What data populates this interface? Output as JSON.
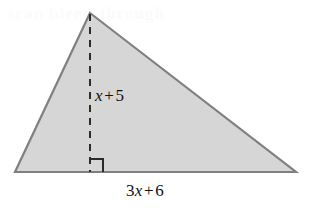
{
  "figure": {
    "kind": "geometry-diagram",
    "shape": "triangle",
    "canvas": {
      "width": 309,
      "height": 212
    },
    "colors": {
      "fill": "#d6d6d6",
      "stroke": "#808080",
      "text": "#111111",
      "background": "#ffffff",
      "ghost": "#fbfbfb"
    },
    "vertices": {
      "apex": {
        "x": 90,
        "y": 13
      },
      "base_left": {
        "x": 15,
        "y": 172
      },
      "base_right": {
        "x": 296,
        "y": 172
      }
    },
    "altitude": {
      "from": {
        "x": 90,
        "y": 13
      },
      "to": {
        "x": 90,
        "y": 172
      },
      "style": "dashed"
    },
    "right_angle_marker": {
      "corner": {
        "x": 90,
        "y": 172
      },
      "size": 13,
      "opens": "right"
    }
  },
  "labels": {
    "height": {
      "text": "x + 5",
      "coefficient": "",
      "variable": "x",
      "operator": "+",
      "constant": "5",
      "role": "altitude-length"
    },
    "base": {
      "text": "3x + 6",
      "coefficient": "3",
      "variable": "x",
      "operator": "+",
      "constant": "6",
      "role": "base-length"
    }
  },
  "artifacts": {
    "ghost_text": "scan bleed-through"
  }
}
